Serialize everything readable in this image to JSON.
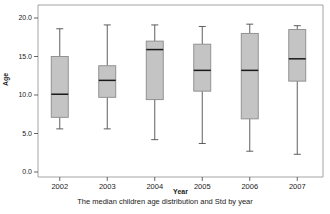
{
  "chart_data": {
    "type": "box",
    "title": "",
    "caption": "The median children age distribution and Std by year",
    "xlabel": "Year",
    "ylabel": "Age",
    "categories": [
      "2002",
      "2003",
      "2004",
      "2005",
      "2006",
      "2007"
    ],
    "ylim": [
      0.0,
      20.0
    ],
    "yticks": [
      0.0,
      5.0,
      10.0,
      15.0,
      20.0
    ],
    "ytick_labels": [
      "0.0",
      "5.0",
      "10.0",
      "15.0",
      "20.0"
    ],
    "grid": false,
    "legend": null,
    "box_fill_color": "#c4c4c4",
    "box_line_color": "#4d4d4d",
    "frame_color": "#9a9a9a",
    "boxes": [
      {
        "category": "2002",
        "whisker_low": 5.6,
        "q1": 7.1,
        "median": 10.1,
        "q3": 15.0,
        "whisker_high": 18.6
      },
      {
        "category": "2003",
        "whisker_low": 5.6,
        "q1": 9.7,
        "median": 11.9,
        "q3": 13.8,
        "whisker_high": 19.1
      },
      {
        "category": "2004",
        "whisker_low": 4.2,
        "q1": 9.4,
        "median": 15.9,
        "q3": 17.0,
        "whisker_high": 19.1
      },
      {
        "category": "2005",
        "whisker_low": 3.7,
        "q1": 10.5,
        "median": 13.2,
        "q3": 16.6,
        "whisker_high": 18.9
      },
      {
        "category": "2006",
        "whisker_low": 2.7,
        "q1": 6.9,
        "median": 13.2,
        "q3": 18.0,
        "whisker_high": 19.2
      },
      {
        "category": "2007",
        "whisker_low": 2.3,
        "q1": 11.8,
        "median": 14.7,
        "q3": 18.5,
        "whisker_high": 19.0
      }
    ]
  }
}
